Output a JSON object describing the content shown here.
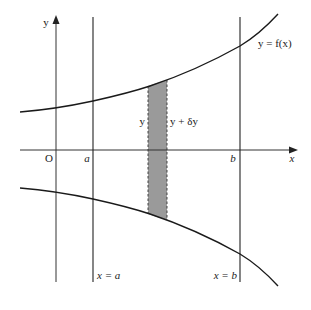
{
  "diagram": {
    "type": "volume-of-revolution-strip",
    "colors": {
      "stroke": "#1a1a1a",
      "axis": "#333333",
      "strip_fill": "#9a9a9a",
      "background": "#ffffff"
    },
    "axes": {
      "x_label": "x",
      "y_label": "y",
      "origin_label": "O"
    },
    "ticks": {
      "a_label": "a",
      "b_label": "b"
    },
    "curve": {
      "label": "y = f(x)"
    },
    "vertical_lines": {
      "a_label": "x = a",
      "b_label": "x = b"
    },
    "strip": {
      "left_label": "y",
      "right_label": "y + δy"
    }
  }
}
